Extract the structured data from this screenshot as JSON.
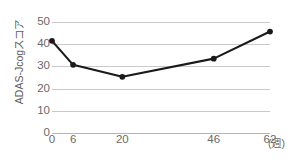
{
  "chart_data": {
    "type": "line",
    "title": "",
    "xlabel": "週",
    "ylabel": "ADAS-Jcogスコア",
    "x": [
      0,
      6,
      20,
      46,
      62
    ],
    "xtick_labels": [
      "0",
      "6",
      "20",
      "46",
      "62"
    ],
    "x_unit_label": "(週)",
    "values": [
      41.5,
      30.7,
      25.3,
      33.5,
      45.7
    ],
    "series": [
      {
        "name": "ADAS-Jcogスコア",
        "values": [
          41.5,
          30.7,
          25.3,
          33.5,
          45.7
        ]
      }
    ],
    "ytick_labels": [
      "0",
      "10",
      "20",
      "30",
      "40",
      "50"
    ],
    "yticks": [
      0,
      10,
      20,
      30,
      40,
      50
    ],
    "ylim": [
      0,
      50
    ],
    "xlim": [
      0,
      62
    ],
    "grid": true,
    "grid_axis": "y",
    "legend": false,
    "legend_position": "none",
    "colors": {
      "line": "#1a1a1a",
      "marker": "#1a1a1a",
      "grid": "#c9c9c9",
      "axis_text": "#6a6a6a",
      "background": "#ffffff"
    }
  }
}
